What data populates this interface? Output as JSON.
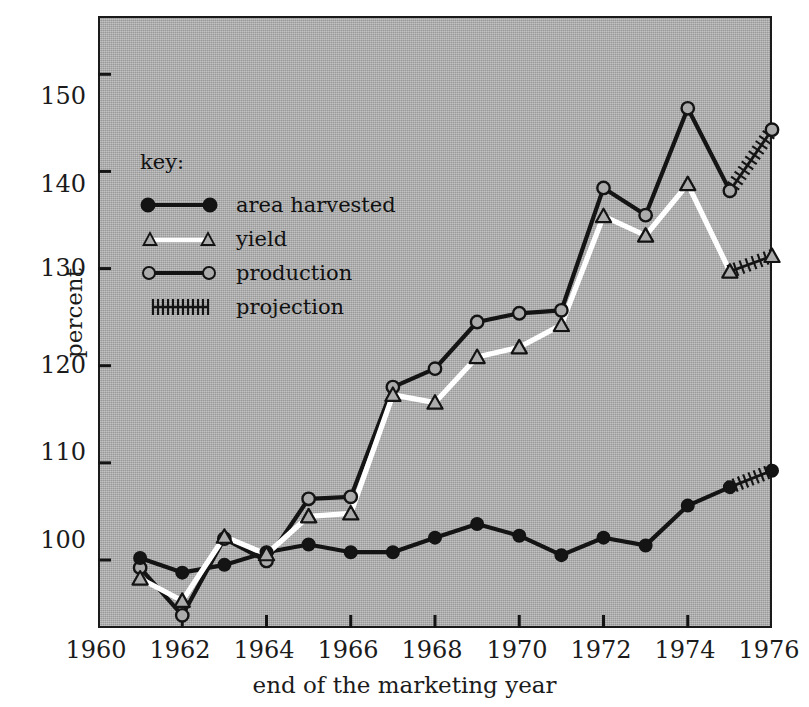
{
  "chart_data": {
    "type": "line",
    "title": "",
    "xlabel": "end of the marketing year",
    "ylabel": "percent",
    "xlim": [
      1960,
      1976
    ],
    "ylim": [
      93,
      156
    ],
    "yticks": [
      100,
      110,
      120,
      130,
      140,
      150
    ],
    "xticks": [
      1960,
      1962,
      1964,
      1966,
      1968,
      1970,
      1972,
      1974,
      1976
    ],
    "grid": false,
    "legend_position": "upper-left-inside",
    "x": [
      1961,
      1962,
      1963,
      1964,
      1965,
      1966,
      1967,
      1968,
      1969,
      1970,
      1971,
      1972,
      1973,
      1974,
      1975,
      1976
    ],
    "series": [
      {
        "name": "area harvested",
        "marker": "filled-circle",
        "color": "#141414",
        "values": [
          100.2,
          98.7,
          99.5,
          100.8,
          101.6,
          100.8,
          100.8,
          102.3,
          103.7,
          102.5,
          100.5,
          102.3,
          101.5,
          105.6,
          107.5,
          109.2
        ],
        "projection_from": 1975
      },
      {
        "name": "yield",
        "marker": "open-triangle",
        "color": "#ffffff",
        "values": [
          98.1,
          95.8,
          102.4,
          100.6,
          104.5,
          104.8,
          117.0,
          116.2,
          120.9,
          121.9,
          124.2,
          135.4,
          133.4,
          138.7,
          129.7,
          131.3
        ],
        "projection_from": 1975
      },
      {
        "name": "production",
        "marker": "open-circle",
        "color": "#141414",
        "values": [
          99.2,
          94.3,
          102.2,
          99.9,
          106.3,
          106.5,
          117.8,
          119.7,
          124.5,
          125.4,
          125.7,
          138.3,
          135.5,
          146.5,
          138.0,
          144.3
        ],
        "projection_from": 1975
      }
    ]
  },
  "axes": {
    "ylabel": "percent",
    "xlabel": "end of the marketing year",
    "yticks": [
      "100",
      "110",
      "120",
      "130",
      "140",
      "150"
    ],
    "xticks": [
      "1960",
      "1962",
      "1964",
      "1966",
      "1968",
      "1970",
      "1972",
      "1974",
      "1976"
    ]
  },
  "legend": {
    "title": "key:",
    "items": [
      {
        "label": "area harvested",
        "marker": "filled-circle-line"
      },
      {
        "label": "yield",
        "marker": "open-triangle-white-line"
      },
      {
        "label": "production",
        "marker": "open-circle-line"
      },
      {
        "label": "projection",
        "marker": "hatched-line"
      }
    ]
  },
  "colors": {
    "plot_background": "#ababab",
    "frame": "#1a1a1a",
    "dark_series": "#141414",
    "light_series": "#ffffff",
    "page_background": "#ffffff"
  }
}
